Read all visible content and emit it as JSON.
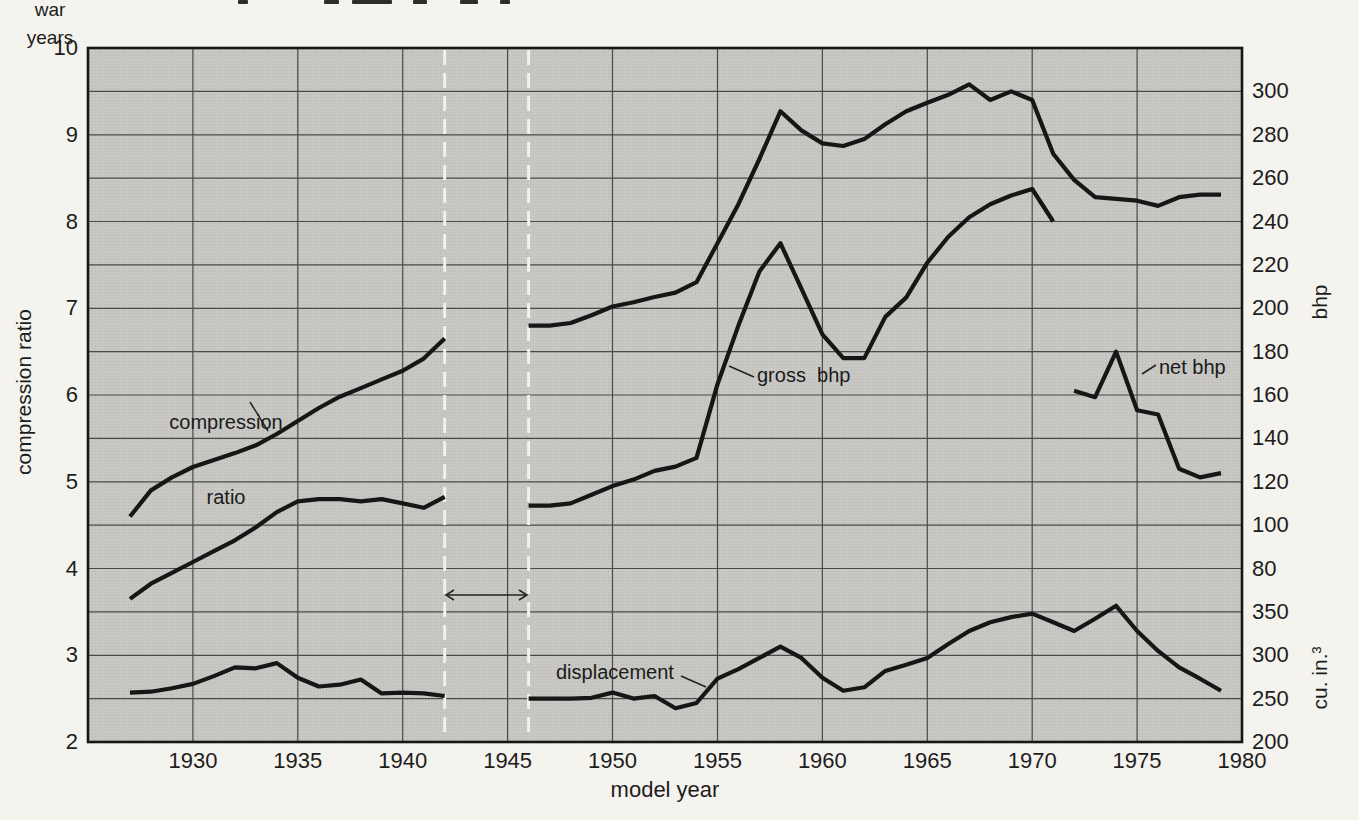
{
  "page": {
    "colors": {
      "page_bg": "#f5f3ee",
      "plot_bg": "#c8c7c3",
      "grid": "#4a4a4a",
      "curve": "#161616",
      "war_dash": "#f3f1ec"
    }
  },
  "chart_data": {
    "type": "line",
    "title": "",
    "xlabel": "model year",
    "x_range": [
      1925,
      1980
    ],
    "x_ticks": [
      1930,
      1935,
      1940,
      1945,
      1950,
      1955,
      1960,
      1965,
      1970,
      1975,
      1980
    ],
    "grid": "on",
    "axes": {
      "compression": {
        "label": "compression ratio",
        "side": "left",
        "min": 2,
        "max": 10,
        "ticks": [
          10,
          9,
          8,
          7,
          6,
          5,
          4,
          3,
          2
        ],
        "gridline_step": 0.5
      },
      "bhp": {
        "label": "bhp",
        "side": "right",
        "min": 80,
        "max": 300,
        "ratio_min": 4,
        "ratio_max": 9.5,
        "ticks": [
          300,
          280,
          260,
          240,
          220,
          200,
          180,
          160,
          140,
          120,
          100,
          80
        ]
      },
      "cuin": {
        "label": "cu. in.³",
        "side": "right",
        "min": 200,
        "max": 350,
        "ratio_min": 2,
        "ratio_max": 3.5,
        "ticks": [
          350,
          300,
          250,
          200
        ]
      }
    },
    "war_gap": {
      "years": [
        1942,
        1946
      ],
      "label": [
        "war",
        "years"
      ]
    },
    "annotations": {
      "compression": {
        "lines": [
          "compression",
          "ratio"
        ]
      },
      "gross": {
        "text": "gross  bhp"
      },
      "net": {
        "text": "net bhp"
      },
      "displacement": {
        "text": "displacement"
      }
    },
    "series": [
      {
        "name": "compression ratio",
        "axis": "compression",
        "segments": {
          "prewar": [
            [
              1927,
              4.6
            ],
            [
              1928,
              4.9
            ],
            [
              1929,
              5.05
            ],
            [
              1930,
              5.17
            ],
            [
              1931,
              5.25
            ],
            [
              1932,
              5.33
            ],
            [
              1933,
              5.42
            ],
            [
              1934,
              5.55
            ],
            [
              1935,
              5.7
            ],
            [
              1936,
              5.85
            ],
            [
              1937,
              5.98
            ],
            [
              1938,
              6.08
            ],
            [
              1939,
              6.18
            ],
            [
              1940,
              6.28
            ],
            [
              1941,
              6.42
            ],
            [
              1942,
              6.65
            ]
          ],
          "postwar": [
            [
              1946,
              6.8
            ],
            [
              1947,
              6.8
            ],
            [
              1948,
              6.83
            ],
            [
              1949,
              6.92
            ],
            [
              1950,
              7.02
            ],
            [
              1951,
              7.07
            ],
            [
              1952,
              7.13
            ],
            [
              1953,
              7.18
            ],
            [
              1954,
              7.3
            ],
            [
              1955,
              7.75
            ],
            [
              1956,
              8.2
            ],
            [
              1957,
              8.72
            ],
            [
              1958,
              9.27
            ],
            [
              1959,
              9.05
            ],
            [
              1960,
              8.9
            ],
            [
              1961,
              8.87
            ],
            [
              1962,
              8.95
            ],
            [
              1963,
              9.12
            ],
            [
              1964,
              9.27
            ],
            [
              1965,
              9.37
            ],
            [
              1966,
              9.46
            ],
            [
              1967,
              9.58
            ],
            [
              1968,
              9.4
            ],
            [
              1969,
              9.5
            ],
            [
              1970,
              9.4
            ],
            [
              1971,
              8.78
            ],
            [
              1972,
              8.48
            ],
            [
              1973,
              8.28
            ],
            [
              1974,
              8.26
            ],
            [
              1975,
              8.24
            ],
            [
              1976,
              8.18
            ],
            [
              1977,
              8.28
            ],
            [
              1978,
              8.31
            ],
            [
              1979,
              8.31
            ]
          ]
        }
      },
      {
        "name": "gross bhp",
        "axis": "bhp",
        "segments": {
          "prewar": [
            [
              1927,
              66
            ],
            [
              1928,
              73
            ],
            [
              1929,
              78
            ],
            [
              1930,
              83
            ],
            [
              1931,
              88
            ],
            [
              1932,
              93
            ],
            [
              1933,
              99
            ],
            [
              1934,
              106
            ],
            [
              1935,
              111
            ],
            [
              1936,
              112
            ],
            [
              1937,
              112
            ],
            [
              1938,
              111
            ],
            [
              1939,
              112
            ],
            [
              1940,
              110
            ],
            [
              1941,
              108
            ],
            [
              1942,
              113
            ]
          ],
          "postwar": [
            [
              1946,
              109
            ],
            [
              1947,
              109
            ],
            [
              1948,
              110
            ],
            [
              1949,
              114
            ],
            [
              1950,
              118
            ],
            [
              1951,
              121
            ],
            [
              1952,
              125
            ],
            [
              1953,
              127
            ],
            [
              1954,
              131
            ],
            [
              1955,
              165
            ],
            [
              1956,
              192
            ],
            [
              1957,
              217
            ],
            [
              1958,
              230
            ],
            [
              1959,
              209
            ],
            [
              1960,
              188
            ],
            [
              1961,
              177
            ],
            [
              1962,
              177
            ],
            [
              1963,
              196
            ],
            [
              1964,
              205
            ],
            [
              1965,
              221
            ],
            [
              1966,
              233
            ],
            [
              1967,
              242
            ],
            [
              1968,
              248
            ],
            [
              1969,
              252
            ],
            [
              1970,
              255
            ],
            [
              1971,
              240
            ]
          ]
        }
      },
      {
        "name": "net bhp",
        "axis": "bhp",
        "segments": {
          "postwar": [
            [
              1972,
              162
            ],
            [
              1973,
              159
            ],
            [
              1974,
              180
            ],
            [
              1975,
              153
            ],
            [
              1976,
              151
            ],
            [
              1977,
              126
            ],
            [
              1978,
              122
            ],
            [
              1979,
              124
            ]
          ]
        }
      },
      {
        "name": "displacement",
        "axis": "cuin",
        "segments": {
          "prewar": [
            [
              1927,
              257
            ],
            [
              1928,
              258
            ],
            [
              1929,
              262
            ],
            [
              1930,
              267
            ],
            [
              1931,
              276
            ],
            [
              1932,
              286
            ],
            [
              1933,
              285
            ],
            [
              1934,
              291
            ],
            [
              1935,
              274
            ],
            [
              1936,
              264
            ],
            [
              1937,
              266
            ],
            [
              1938,
              272
            ],
            [
              1939,
              256
            ],
            [
              1940,
              257
            ],
            [
              1941,
              256
            ],
            [
              1942,
              253
            ]
          ],
          "postwar": [
            [
              1946,
              250
            ],
            [
              1947,
              250
            ],
            [
              1948,
              250
            ],
            [
              1949,
              251
            ],
            [
              1950,
              257
            ],
            [
              1951,
              250
            ],
            [
              1952,
              253
            ],
            [
              1953,
              239
            ],
            [
              1954,
              245
            ],
            [
              1955,
              273
            ],
            [
              1956,
              284
            ],
            [
              1957,
              297
            ],
            [
              1958,
              310
            ],
            [
              1959,
              297
            ],
            [
              1960,
              274
            ],
            [
              1961,
              259
            ],
            [
              1962,
              263
            ],
            [
              1963,
              282
            ],
            [
              1964,
              289
            ],
            [
              1965,
              297
            ],
            [
              1966,
              313
            ],
            [
              1967,
              328
            ],
            [
              1968,
              338
            ],
            [
              1969,
              344
            ],
            [
              1970,
              348
            ],
            [
              1971,
              338
            ],
            [
              1972,
              328
            ],
            [
              1973,
              342
            ],
            [
              1974,
              357
            ],
            [
              1975,
              328
            ],
            [
              1976,
              305
            ],
            [
              1977,
              286
            ],
            [
              1978,
              273
            ],
            [
              1979,
              259
            ]
          ]
        }
      }
    ]
  }
}
